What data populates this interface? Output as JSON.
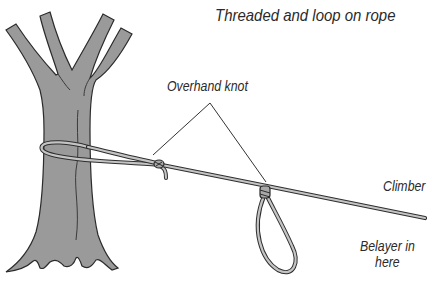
{
  "diagram": {
    "title": "Threaded and loop on rope",
    "labels": {
      "overhand_knot": "Overhand knot",
      "climber": "Climber",
      "belayer_line1": "Belayer in",
      "belayer_line2": "here"
    },
    "elements": [
      "tree",
      "rope",
      "overhand-knot-near-tree",
      "overhand-knot-loop",
      "belay-loop",
      "leader-lines"
    ],
    "colors": {
      "tree_fill": "#9a9a9a",
      "outline": "#333333",
      "rope_fill": "#bdbdbd",
      "text": "#2a2a2a",
      "background": "#ffffff"
    }
  }
}
